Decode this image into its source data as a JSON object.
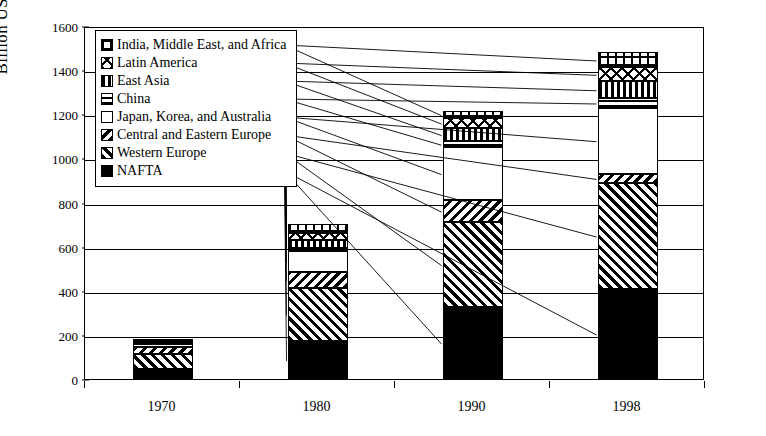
{
  "chart_data": {
    "type": "bar",
    "stacked": true,
    "title": "",
    "xlabel": "",
    "ylabel": "Billion USD",
    "categories": [
      "1970",
      "1980",
      "1990",
      "1998"
    ],
    "ylim": [
      0,
      1600
    ],
    "ytick_step": 200,
    "yticks": [
      "0",
      "200",
      "400",
      "600",
      "800",
      "1000",
      "1200",
      "1400",
      "1600"
    ],
    "grid": true,
    "legend_position": "top-left",
    "series": [
      {
        "name": "NAFTA",
        "pattern": "solid-black",
        "values": [
          45,
          172,
          326,
          408
        ]
      },
      {
        "name": "Western Europe",
        "pattern": "diagonal-hatch",
        "values": [
          70,
          240,
          385,
          480
        ]
      },
      {
        "name": "Central and Eastern Europe",
        "pattern": "reverse-diagonal-hatch",
        "values": [
          32,
          72,
          100,
          42
        ]
      },
      {
        "name": "Japan, Korea, and Australia",
        "pattern": "white",
        "values": [
          13,
          98,
          240,
          300
        ]
      },
      {
        "name": "China",
        "pattern": "horizontal-lines",
        "values": [
          2,
          12,
          26,
          42
        ]
      },
      {
        "name": "East Asia",
        "pattern": "vertical-lines",
        "values": [
          4,
          38,
          62,
          78
        ]
      },
      {
        "name": "Latin America",
        "pattern": "cross-diagonal",
        "values": [
          6,
          28,
          42,
          62
        ]
      },
      {
        "name": "India, Middle East, and Africa",
        "pattern": "grid",
        "values": [
          6,
          42,
          34,
          68
        ]
      }
    ],
    "totals": [
      178,
      702,
      1215,
      1480
    ]
  },
  "legend": {
    "items": [
      {
        "label": "India, Middle East, and Africa",
        "pattern": "grid"
      },
      {
        "label": "Latin America",
        "pattern": "cross-diagonal"
      },
      {
        "label": "East Asia",
        "pattern": "vertical-lines"
      },
      {
        "label": "China",
        "pattern": "horizontal-lines"
      },
      {
        "label": "Japan, Korea, and Australia",
        "pattern": "white"
      },
      {
        "label": "Central and Eastern Europe",
        "pattern": "reverse-diagonal-hatch"
      },
      {
        "label": "Western Europe",
        "pattern": "diagonal-hatch"
      },
      {
        "label": "NAFTA",
        "pattern": "solid-black"
      }
    ]
  },
  "colors": {
    "foreground": "#000000",
    "background": "#ffffff"
  }
}
